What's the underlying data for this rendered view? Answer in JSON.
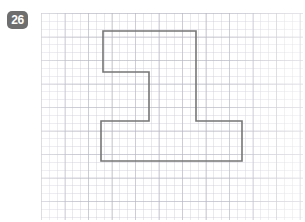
{
  "page": {
    "width": 305,
    "height": 222,
    "background_color": "#ffffff"
  },
  "badge": {
    "label": "26",
    "background_color": "#6e6e6e",
    "text_color": "#ffffff"
  },
  "grid": {
    "name": "graph-paper",
    "minor_cell_px": 7.83,
    "major_cell_px": 23.5,
    "minor_line_color": "#c8c8d4",
    "major_line_color": "#b2b2be",
    "paper_color": "#ffffff",
    "origin_x": 41,
    "origin_y": 13,
    "width": 262,
    "height": 207
  },
  "figure": {
    "name": "z-shaped-polygon",
    "stroke_color": "#767676",
    "stroke_width": 1.6,
    "fill": "none",
    "points": "103,31 196,31 196,121 242,121 242,161 101,161 101,121 149,121 149,72 103,72",
    "vertices": [
      {
        "x": 103,
        "y": 31
      },
      {
        "x": 196,
        "y": 31
      },
      {
        "x": 196,
        "y": 121
      },
      {
        "x": 242,
        "y": 121
      },
      {
        "x": 242,
        "y": 161
      },
      {
        "x": 101,
        "y": 161
      },
      {
        "x": 101,
        "y": 121
      },
      {
        "x": 149,
        "y": 121
      },
      {
        "x": 149,
        "y": 72
      },
      {
        "x": 103,
        "y": 72
      }
    ]
  }
}
